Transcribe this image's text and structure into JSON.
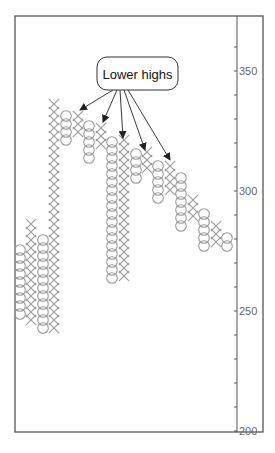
{
  "chart_data": {
    "type": "point-and-figure",
    "title": "",
    "xlabel": "",
    "ylabel": "",
    "ylim": [
      200,
      365
    ],
    "y_ticks": [
      350,
      300,
      250,
      200
    ],
    "y_minor_tick_step": 10,
    "grid": false,
    "annotation": {
      "text": "Lower highs",
      "arrow_count": 5
    },
    "columns": [
      {
        "type": "O",
        "x": 20,
        "y_top": 246,
        "y_bottom": 318,
        "high": 280,
        "low": 254
      },
      {
        "type": "X",
        "x": 31,
        "y_top": 220,
        "y_bottom": 322,
        "high": 290,
        "low": 254
      },
      {
        "type": "O",
        "x": 43,
        "y_top": 236,
        "y_bottom": 334,
        "high": 284,
        "low": 248
      },
      {
        "type": "X",
        "x": 54,
        "y_top": 100,
        "y_bottom": 328,
        "high": 338,
        "low": 253
      },
      {
        "type": "O",
        "x": 66,
        "y_top": 112,
        "y_bottom": 144,
        "high": 333,
        "low": 320
      },
      {
        "type": "X",
        "x": 78,
        "y_top": 112,
        "y_bottom": 136,
        "high": 333,
        "low": 323
      },
      {
        "type": "O",
        "x": 89,
        "y_top": 122,
        "y_bottom": 162,
        "high": 328,
        "low": 311
      },
      {
        "type": "X",
        "x": 101,
        "y_top": 124,
        "y_bottom": 148,
        "high": 328,
        "low": 318
      },
      {
        "type": "O",
        "x": 112,
        "y_top": 138,
        "y_bottom": 284,
        "high": 322,
        "low": 262
      },
      {
        "type": "X",
        "x": 124,
        "y_top": 136,
        "y_bottom": 276,
        "high": 323,
        "low": 265
      },
      {
        "type": "O",
        "x": 136,
        "y_top": 150,
        "y_bottom": 182,
        "high": 317,
        "low": 304
      },
      {
        "type": "X",
        "x": 147,
        "y_top": 148,
        "y_bottom": 172,
        "high": 318,
        "low": 308
      },
      {
        "type": "O",
        "x": 158,
        "y_top": 162,
        "y_bottom": 202,
        "high": 312,
        "low": 295
      },
      {
        "type": "X",
        "x": 170,
        "y_top": 162,
        "y_bottom": 194,
        "high": 312,
        "low": 298
      },
      {
        "type": "O",
        "x": 181,
        "y_top": 174,
        "y_bottom": 230,
        "high": 307,
        "low": 284
      },
      {
        "type": "X",
        "x": 193,
        "y_top": 196,
        "y_bottom": 220,
        "high": 298,
        "low": 288
      },
      {
        "type": "O",
        "x": 204,
        "y_top": 210,
        "y_bottom": 250,
        "high": 292,
        "low": 275
      },
      {
        "type": "X",
        "x": 216,
        "y_top": 222,
        "y_bottom": 246,
        "high": 287,
        "low": 277
      },
      {
        "type": "O",
        "x": 227,
        "y_top": 234,
        "y_bottom": 250,
        "high": 282,
        "low": 275
      }
    ],
    "arrows": [
      {
        "from": [
          113,
          90
        ],
        "to": [
          80,
          110
        ]
      },
      {
        "from": [
          117,
          90
        ],
        "to": [
          103,
          122
        ]
      },
      {
        "from": [
          120,
          90
        ],
        "to": [
          123,
          138
        ]
      },
      {
        "from": [
          124,
          90
        ],
        "to": [
          145,
          150
        ]
      },
      {
        "from": [
          128,
          90
        ],
        "to": [
          170,
          160
        ]
      }
    ]
  },
  "frame": {
    "left": 15,
    "top": 16,
    "right": 263,
    "bottom": 432,
    "axis_x": 237
  },
  "axis": {
    "px_per_unit": 2.4,
    "ref_value": 350,
    "ref_y": 71
  },
  "colors": {
    "symbol": "#9a9a9a",
    "frame": "#555555",
    "arrow": "#222222",
    "text": "#666666",
    "callout_text": "#111111"
  }
}
